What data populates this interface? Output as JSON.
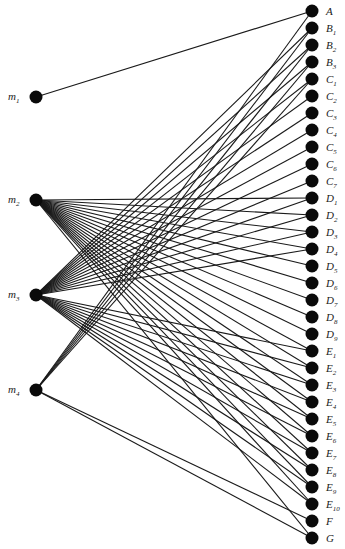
{
  "diagram": {
    "type": "bipartite-graph",
    "left_nodes": [
      {
        "id": "m1",
        "base": "m",
        "sub": "1",
        "x": 36,
        "y": 97
      },
      {
        "id": "m2",
        "base": "m",
        "sub": "2",
        "x": 36,
        "y": 200
      },
      {
        "id": "m3",
        "base": "m",
        "sub": "3",
        "x": 36,
        "y": 295
      },
      {
        "id": "m4",
        "base": "m",
        "sub": "4",
        "x": 36,
        "y": 390
      }
    ],
    "right_nodes": [
      {
        "id": "A",
        "base": "A",
        "sub": "",
        "y": 11
      },
      {
        "id": "B1",
        "base": "B",
        "sub": "1",
        "y": 28
      },
      {
        "id": "B2",
        "base": "B",
        "sub": "2",
        "y": 45
      },
      {
        "id": "B3",
        "base": "B",
        "sub": "3",
        "y": 62
      },
      {
        "id": "C1",
        "base": "C",
        "sub": "1",
        "y": 79
      },
      {
        "id": "C2",
        "base": "C",
        "sub": "2",
        "y": 96
      },
      {
        "id": "C3",
        "base": "C",
        "sub": "3",
        "y": 113
      },
      {
        "id": "C4",
        "base": "C",
        "sub": "4",
        "y": 130
      },
      {
        "id": "C5",
        "base": "C",
        "sub": "5",
        "y": 147
      },
      {
        "id": "C6",
        "base": "C",
        "sub": "6",
        "y": 164
      },
      {
        "id": "C7",
        "base": "C",
        "sub": "7",
        "y": 181
      },
      {
        "id": "D1",
        "base": "D",
        "sub": "1",
        "y": 198
      },
      {
        "id": "D2",
        "base": "D",
        "sub": "2",
        "y": 215
      },
      {
        "id": "D3",
        "base": "D",
        "sub": "3",
        "y": 232
      },
      {
        "id": "D4",
        "base": "D",
        "sub": "4",
        "y": 249
      },
      {
        "id": "D5",
        "base": "D",
        "sub": "5",
        "y": 266
      },
      {
        "id": "D6",
        "base": "D",
        "sub": "6",
        "y": 283
      },
      {
        "id": "D7",
        "base": "D",
        "sub": "7",
        "y": 300
      },
      {
        "id": "D8",
        "base": "D",
        "sub": "8",
        "y": 317
      },
      {
        "id": "D9",
        "base": "D",
        "sub": "9",
        "y": 334
      },
      {
        "id": "E1",
        "base": "E",
        "sub": "1",
        "y": 351
      },
      {
        "id": "E2",
        "base": "E",
        "sub": "2",
        "y": 368
      },
      {
        "id": "E3",
        "base": "E",
        "sub": "3",
        "y": 385
      },
      {
        "id": "E4",
        "base": "E",
        "sub": "4",
        "y": 402
      },
      {
        "id": "E5",
        "base": "E",
        "sub": "5",
        "y": 419
      },
      {
        "id": "E6",
        "base": "E",
        "sub": "6",
        "y": 436
      },
      {
        "id": "E7",
        "base": "E",
        "sub": "7",
        "y": 453
      },
      {
        "id": "E8",
        "base": "E",
        "sub": "8",
        "y": 470
      },
      {
        "id": "E9",
        "base": "E",
        "sub": "9",
        "y": 487
      },
      {
        "id": "E10",
        "base": "E",
        "sub": "10",
        "y": 504
      },
      {
        "id": "F",
        "base": "F",
        "sub": "",
        "y": 521
      },
      {
        "id": "G",
        "base": "G",
        "sub": "",
        "y": 538
      }
    ],
    "right_x": 312,
    "edges": [
      [
        "m1",
        "A"
      ],
      [
        "m2",
        "D1"
      ],
      [
        "m2",
        "D2"
      ],
      [
        "m2",
        "D3"
      ],
      [
        "m2",
        "D4"
      ],
      [
        "m2",
        "D5"
      ],
      [
        "m2",
        "D6"
      ],
      [
        "m2",
        "D7"
      ],
      [
        "m2",
        "D8"
      ],
      [
        "m2",
        "D9"
      ],
      [
        "m2",
        "E1"
      ],
      [
        "m2",
        "E2"
      ],
      [
        "m2",
        "E3"
      ],
      [
        "m2",
        "E4"
      ],
      [
        "m2",
        "E5"
      ],
      [
        "m2",
        "E6"
      ],
      [
        "m2",
        "E7"
      ],
      [
        "m2",
        "E8"
      ],
      [
        "m2",
        "E9"
      ],
      [
        "m2",
        "E10"
      ],
      [
        "m2",
        "G"
      ],
      [
        "m3",
        "B1"
      ],
      [
        "m3",
        "B2"
      ],
      [
        "m3",
        "B3"
      ],
      [
        "m3",
        "C1"
      ],
      [
        "m3",
        "C2"
      ],
      [
        "m3",
        "C3"
      ],
      [
        "m3",
        "C4"
      ],
      [
        "m3",
        "C5"
      ],
      [
        "m3",
        "C6"
      ],
      [
        "m3",
        "C7"
      ],
      [
        "m3",
        "D1"
      ],
      [
        "m3",
        "D2"
      ],
      [
        "m3",
        "D3"
      ],
      [
        "m3",
        "D4"
      ],
      [
        "m3",
        "E1"
      ],
      [
        "m3",
        "E2"
      ],
      [
        "m3",
        "E3"
      ],
      [
        "m3",
        "E4"
      ],
      [
        "m3",
        "E5"
      ],
      [
        "m3",
        "E6"
      ],
      [
        "m3",
        "E7"
      ],
      [
        "m3",
        "E8"
      ],
      [
        "m3",
        "E9"
      ],
      [
        "m3",
        "E10"
      ],
      [
        "m4",
        "A"
      ],
      [
        "m4",
        "B1"
      ],
      [
        "m4",
        "B2"
      ],
      [
        "m4",
        "B3"
      ],
      [
        "m4",
        "C1"
      ],
      [
        "m4",
        "F"
      ],
      [
        "m4",
        "G"
      ]
    ],
    "colors": {
      "node": "#0a0a0a",
      "edge": "#1a1a1a",
      "background": "#ffffff"
    }
  }
}
